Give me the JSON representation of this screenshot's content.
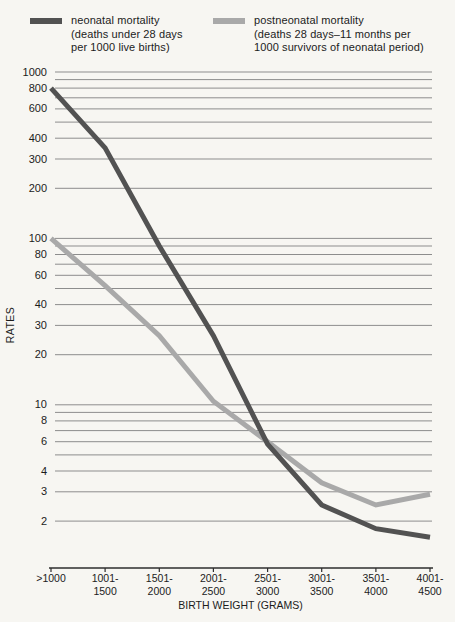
{
  "legend": {
    "items": [
      {
        "name": "neonatal mortality",
        "color": "#525252",
        "lines": [
          "neonatal mortality",
          "(deaths under 28 days",
          "per 1000 live births)"
        ]
      },
      {
        "name": "postneonatal mortality",
        "color": "#a9a9a9",
        "lines": [
          "postneonatal mortality",
          "(deaths 28 days–11 months per",
          "1000 survivors of neonatal period)"
        ]
      }
    ]
  },
  "chart_data": {
    "type": "line",
    "categories": [
      ">1000",
      "1001-1500",
      "1501-2000",
      "2001-2500",
      "2501-3000",
      "3001-3500",
      "3501-4000",
      "4001-4500"
    ],
    "x_tick_label_lines": [
      [
        ">1000"
      ],
      [
        "1001-",
        "1500"
      ],
      [
        "1501-",
        "2000"
      ],
      [
        "2001-",
        "2500"
      ],
      [
        "2501-",
        "3000"
      ],
      [
        "3001-",
        "3500"
      ],
      [
        "3501-",
        "4000"
      ],
      [
        "4001-",
        "4500"
      ]
    ],
    "series": [
      {
        "name": "neonatal mortality",
        "color": "#525252",
        "values": [
          800,
          350,
          90,
          26,
          5.8,
          2.5,
          1.8,
          1.6
        ]
      },
      {
        "name": "postneonatal mortality",
        "color": "#a9a9a9",
        "values": [
          100,
          52,
          26,
          10.5,
          6.0,
          3.4,
          2.5,
          2.9
        ]
      }
    ],
    "xlabel": "BIRTH WEIGHT (GRAMS)",
    "ylabel": "RATES",
    "y_scale": "log",
    "y_tick_labels": [
      1000,
      800,
      600,
      400,
      300,
      200,
      100,
      80,
      60,
      40,
      30,
      20,
      10,
      8,
      6,
      4,
      3,
      2
    ],
    "ylim": [
      1.05,
      1000
    ],
    "grid": "horizontal log minor lines (2-10, 20-100, 200-1000)",
    "legend_position": "top"
  },
  "colors": {
    "background": "#f7f6f2",
    "grid": "#8d8d8d",
    "axis": "#2e2e2e",
    "text": "#1c1c1c"
  }
}
